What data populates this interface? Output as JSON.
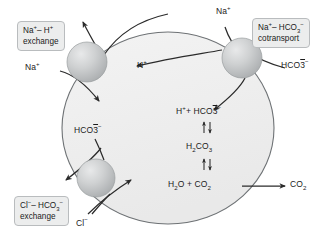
{
  "figure": {
    "name": "acid-base-transport-cell-diagram",
    "cell": {
      "fill": "#f0f0f0",
      "stroke": "#6e7275"
    },
    "transporter_fill": "#c9cbcc"
  },
  "callouts": [
    {
      "id": "na-h-exchange",
      "line1": "Na⁻ – H⁺",
      "line1_html": "Na<sup>+</sup>– H<sup>+</sup>",
      "line2": "exchange"
    },
    {
      "id": "na-hco3-cotransport",
      "line1_html": "Na<sup>+</sup>– HCO<sub>3</sub><sup>−</sup>",
      "line2": "cotransport"
    },
    {
      "id": "cl-hco3-exchange",
      "line1_html": "Cl<sup>−</sup>– HCO<sub>3</sub><sup>−</sup>",
      "line2": "exchange"
    }
  ],
  "ion_labels": {
    "na_left": "Na+",
    "na_top": "Na+",
    "h_intracellular": "H+",
    "hco3_right": "HCO3-",
    "hco3_left": "HCO3-",
    "cl_bottom": "Cl-",
    "co2_out": "CO2"
  },
  "reaction": {
    "step1": "H+ + HCO3-",
    "step2": "H2CO3",
    "step3": "H2O + CO2",
    "product": "CO2",
    "equilibrium_symbol": "reversible-double-arrow"
  },
  "transporters": [
    {
      "id": "na-h-exchanger",
      "cx": 87,
      "cy": 62,
      "r": 20
    },
    {
      "id": "na-hco3-cotransporter",
      "cx": 242,
      "cy": 58,
      "r": 20
    },
    {
      "id": "cl-hco3-exchanger",
      "cx": 96,
      "cy": 178,
      "r": 19
    }
  ]
}
